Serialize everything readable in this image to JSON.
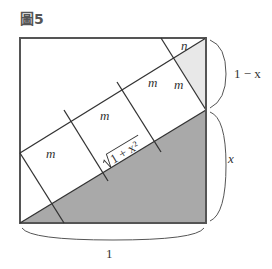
{
  "figure": {
    "title": "圖5",
    "colors": {
      "dark_region": "#a9a9a9",
      "light_region": "#e8e8e8",
      "stroke": "#333333"
    },
    "labels": {
      "m1": "m",
      "m2": "m",
      "m3": "m",
      "m4": "m",
      "n": "n",
      "sqrt": "1 + x²",
      "right_top": "1 − x",
      "right_bottom": "x",
      "bottom": "1"
    }
  }
}
